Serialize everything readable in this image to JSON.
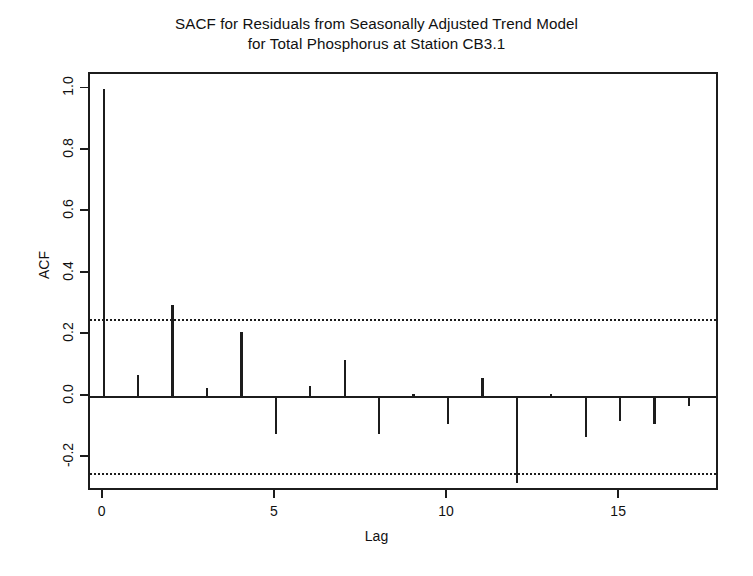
{
  "chart_data": {
    "type": "bar",
    "title": "SACF for Residuals from Seasonally Adjusted Trend Model for Total Phosphorus at Station CB3.1",
    "title_lines": [
      "SACF for Residuals from Seasonally Adjusted Trend Model",
      "for Total Phosphorus at Station CB3.1"
    ],
    "xlabel": "Lag",
    "ylabel": "ACF",
    "xlim": [
      -0.4,
      17.9
    ],
    "ylim": [
      -0.31,
      1.05
    ],
    "xticks": [
      0,
      5,
      10,
      15
    ],
    "xtick_labels": [
      "0",
      "5",
      "10",
      "15"
    ],
    "yticks": [
      -0.2,
      0.0,
      0.2,
      0.4,
      0.6,
      0.8,
      1.0
    ],
    "ytick_labels": [
      "-0.2",
      "0.0",
      "0.2",
      "0.4",
      "0.6",
      "0.8",
      "1.0"
    ],
    "grid": false,
    "legend": null,
    "confidence_bands": [
      0.25,
      -0.25
    ],
    "confidence_band_style": "dotted",
    "zero_line": 0.0,
    "categories": [
      0,
      1,
      2,
      3,
      4,
      5,
      6,
      7,
      8,
      9,
      10,
      11,
      12,
      13,
      14,
      15,
      16,
      17
    ],
    "values": [
      1.0,
      0.07,
      0.3,
      0.03,
      0.21,
      -0.12,
      0.035,
      0.12,
      -0.12,
      0.01,
      -0.09,
      0.06,
      -0.28,
      0.01,
      -0.13,
      -0.08,
      -0.09,
      -0.03
    ],
    "series": [
      {
        "name": "ACF",
        "values": [
          1.0,
          0.07,
          0.3,
          0.03,
          0.21,
          -0.12,
          0.035,
          0.12,
          -0.12,
          0.01,
          -0.09,
          0.06,
          -0.28,
          0.01,
          -0.13,
          -0.08,
          -0.09,
          -0.03
        ]
      }
    ],
    "colors": {
      "spike": "#1c1c1c",
      "axis": "#1c1c1c",
      "background": "#ffffff"
    }
  }
}
